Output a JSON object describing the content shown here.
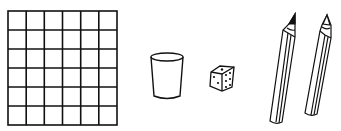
{
  "illustration": {
    "background": "#ffffff",
    "stroke_color": "#111111",
    "objects": [
      {
        "name": "grid",
        "rows": 6,
        "cols": 6
      },
      {
        "name": "cup"
      },
      {
        "name": "die"
      },
      {
        "name": "pencil-left",
        "tip": "dark"
      },
      {
        "name": "pencil-right",
        "tip": "light"
      }
    ]
  }
}
